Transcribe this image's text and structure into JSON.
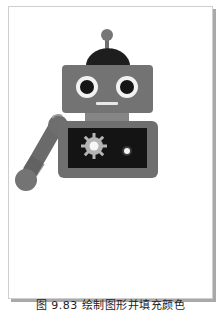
{
  "figure": {
    "caption": "图 9.83  绘制图形并填充颜色",
    "illustration": "robot",
    "colors": {
      "body": "#727272",
      "body_dark": "#5e5e5e",
      "dome": "#1e1e1e",
      "screen": "#141414",
      "eye_ring": "#f2f2f2",
      "pupil": "#161616",
      "gear": "#b5b5b5",
      "light": "#f4f4f4",
      "neck": "#888888",
      "frame_border": "#cfcfcf",
      "frame_shadow": "#a9a9a9"
    }
  }
}
